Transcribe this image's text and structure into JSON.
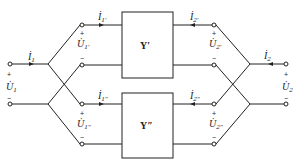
{
  "diagram": {
    "networks": [
      {
        "id": "top",
        "label": "Y′"
      },
      {
        "id": "bottom",
        "label": "Y″"
      }
    ],
    "labels": {
      "I1": "İ",
      "I1_sub": "1",
      "U1": "U̇",
      "U1_sub": "1",
      "I2": "İ",
      "I2_sub": "2",
      "U2": "U̇",
      "U2_sub": "2",
      "I1p_sub": "1′",
      "U1p_sub": "1′",
      "I2p_sub": "2′",
      "U2p_sub": "2′",
      "I1pp_sub": "1″",
      "U1pp_sub": "1″",
      "I2pp_sub": "2″",
      "U2pp_sub": "2″",
      "plus": "+",
      "minus": "−"
    },
    "colors": {
      "line": "#222222",
      "background": "#ffffff"
    }
  }
}
